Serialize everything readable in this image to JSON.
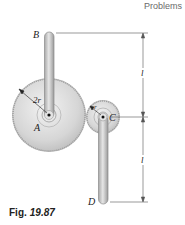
{
  "header": {
    "section": "Problems"
  },
  "figure": {
    "labels": {
      "B": "B",
      "A": "A",
      "C": "C",
      "D": "D",
      "radius_large": "2r",
      "radius_small": "r",
      "length_upper": "l",
      "length_lower": "l"
    },
    "caption": {
      "prefix": "Fig.",
      "number": "19.87"
    }
  }
}
